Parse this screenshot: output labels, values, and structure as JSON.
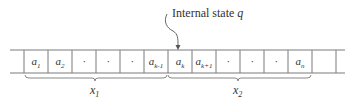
{
  "title": {
    "text": "Internal state ",
    "variable": "q"
  },
  "tape": {
    "cells": [
      {
        "base": "",
        "sub": ""
      },
      {
        "base": "a",
        "sub": "1"
      },
      {
        "base": "a",
        "sub": "2"
      },
      {
        "base": "·",
        "sub": ""
      },
      {
        "base": "·",
        "sub": ""
      },
      {
        "base": "·",
        "sub": ""
      },
      {
        "base": "a",
        "sub": "k-1"
      },
      {
        "base": "a",
        "sub": "k"
      },
      {
        "base": "a",
        "sub": "k+1"
      },
      {
        "base": "·",
        "sub": ""
      },
      {
        "base": "·",
        "sub": ""
      },
      {
        "base": "·",
        "sub": ""
      },
      {
        "base": "a",
        "sub": "n"
      },
      {
        "base": "",
        "sub": ""
      }
    ],
    "head_cell_index": 7
  },
  "braces": [
    {
      "label_base": "x",
      "label_sub": "1",
      "from_cell": 1,
      "to_cell": 6
    },
    {
      "label_base": "x",
      "label_sub": "2",
      "from_cell": 7,
      "to_cell": 12
    }
  ],
  "colors": {
    "line": "#7a7a7a",
    "text": "#333333"
  }
}
